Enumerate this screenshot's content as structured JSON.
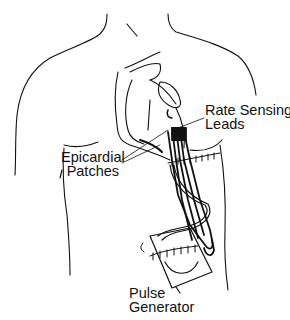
{
  "diagram": {
    "labels": {
      "rate_sensing_leads": {
        "line1": "Rate Sensing",
        "line2": "Leads"
      },
      "epicardial_patches": {
        "line1": "Epicardial",
        "line2": "Patches"
      },
      "pulse_generator": {
        "line1": "Pulse",
        "line2": "Generator"
      }
    },
    "colors": {
      "ink": "#111111",
      "background": "#ffffff"
    }
  }
}
